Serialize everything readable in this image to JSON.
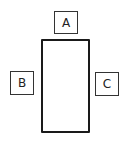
{
  "diagram": {
    "labels": {
      "top": "A",
      "left": "B",
      "right": "C"
    },
    "main_shape": "rectangle"
  }
}
